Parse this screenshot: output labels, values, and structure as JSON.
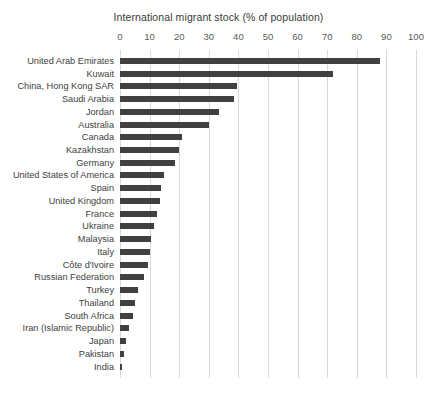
{
  "chart_data": {
    "type": "bar",
    "orientation": "horizontal",
    "title": "International migrant stock (% of population)",
    "xlabel": "",
    "ylabel": "",
    "xlim": [
      0,
      100
    ],
    "xticks": [
      0,
      10,
      20,
      30,
      40,
      50,
      60,
      70,
      80,
      90,
      100
    ],
    "grid": true,
    "legend": false,
    "bar_color": "#404040",
    "gridline_color": "#d9d9d9",
    "categories": [
      "United Arab Emirates",
      "Kuwait",
      "China, Hong Kong SAR",
      "Saudi Arabia",
      "Jordan",
      "Australia",
      "Canada",
      "Kazakhstan",
      "Germany",
      "United States of America",
      "Spain",
      "United Kingdom",
      "France",
      "Ukraine",
      "Malaysia",
      "Italy",
      "Côte d'Ivoire",
      "Russian Federation",
      "Turkey",
      "Thailand",
      "South Africa",
      "Iran (Islamic Republic)",
      "Japan",
      "Pakistan",
      "India"
    ],
    "values": [
      88.0,
      72.0,
      39.5,
      38.5,
      33.5,
      30.0,
      21.0,
      20.0,
      18.5,
      15.0,
      14.0,
      13.5,
      12.5,
      11.5,
      10.5,
      10.0,
      9.5,
      8.0,
      6.0,
      5.0,
      4.5,
      3.2,
      2.0,
      1.4,
      0.4
    ]
  }
}
